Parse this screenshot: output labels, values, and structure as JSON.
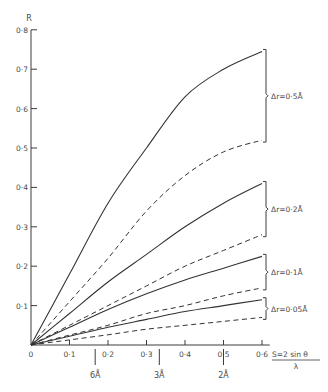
{
  "chart_data": {
    "type": "line",
    "title": "",
    "xlabel": "S = 2 sin θ / λ",
    "xlabel_num": "S=2 sin θ",
    "xlabel_den": "λ",
    "ylabel": "R",
    "xlim": [
      0,
      0.6
    ],
    "ylim": [
      0,
      0.8
    ],
    "grid": false,
    "x_ticks": [
      "0",
      "0·1",
      "0·2",
      "0·3",
      "0·4",
      "0·5",
      "0·6"
    ],
    "y_ticks": [
      "0·1",
      "0·2",
      "0·3",
      "0·4",
      "0·5",
      "0·6",
      "0·7",
      "0·8"
    ],
    "secondary_x_ticks": [
      {
        "label": "6Å",
        "s": 0.1667
      },
      {
        "label": "3Å",
        "s": 0.3333
      },
      {
        "label": "2Å",
        "s": 0.5
      }
    ],
    "x": [
      0,
      0.1,
      0.2,
      0.3,
      0.4,
      0.5,
      0.6
    ],
    "series": [
      {
        "name": "Δr=0·5Å (solid)",
        "style": "solid",
        "group": "Δr=0·5Å",
        "values": [
          0,
          0.18,
          0.36,
          0.5,
          0.63,
          0.7,
          0.745
        ]
      },
      {
        "name": "Δr=0·5Å (dashed)",
        "style": "dashed",
        "group": "Δr=0·5Å",
        "values": [
          0,
          0.11,
          0.22,
          0.34,
          0.43,
          0.49,
          0.52
        ]
      },
      {
        "name": "Δr=0·2Å (solid)",
        "style": "solid",
        "group": "Δr=0·2Å",
        "values": [
          0,
          0.08,
          0.16,
          0.23,
          0.3,
          0.36,
          0.41
        ]
      },
      {
        "name": "Δr=0·2Å (dashed)",
        "style": "dashed",
        "group": "Δr=0·2Å",
        "values": [
          0,
          0.05,
          0.1,
          0.15,
          0.2,
          0.24,
          0.28
        ]
      },
      {
        "name": "Δr=0·1Å (solid)",
        "style": "solid",
        "group": "Δr=0·1Å",
        "values": [
          0,
          0.045,
          0.09,
          0.13,
          0.165,
          0.195,
          0.225
        ]
      },
      {
        "name": "Δr=0·1Å (dashed)",
        "style": "dashed",
        "group": "Δr=0·1Å",
        "values": [
          0,
          0.025,
          0.05,
          0.08,
          0.1,
          0.125,
          0.145
        ]
      },
      {
        "name": "Δr=0·05Å (solid)",
        "style": "solid",
        "group": "Δr=0·05Å",
        "values": [
          0,
          0.022,
          0.045,
          0.065,
          0.085,
          0.1,
          0.115
        ]
      },
      {
        "name": "Δr=0·05Å (dashed)",
        "style": "dashed",
        "group": "Δr=0·05Å",
        "values": [
          0,
          0.013,
          0.026,
          0.04,
          0.05,
          0.06,
          0.07
        ]
      }
    ],
    "annotations": [
      {
        "label": "Δr=0·5Å",
        "top": 0.745,
        "bottom": 0.52
      },
      {
        "label": "Δr=0·2Å",
        "top": 0.41,
        "bottom": 0.28
      },
      {
        "label": "Δr=0·1Å",
        "top": 0.225,
        "bottom": 0.145
      },
      {
        "label": "Δr=0·05Å",
        "top": 0.115,
        "bottom": 0.07
      }
    ],
    "legend_position": "right (brackets)"
  }
}
